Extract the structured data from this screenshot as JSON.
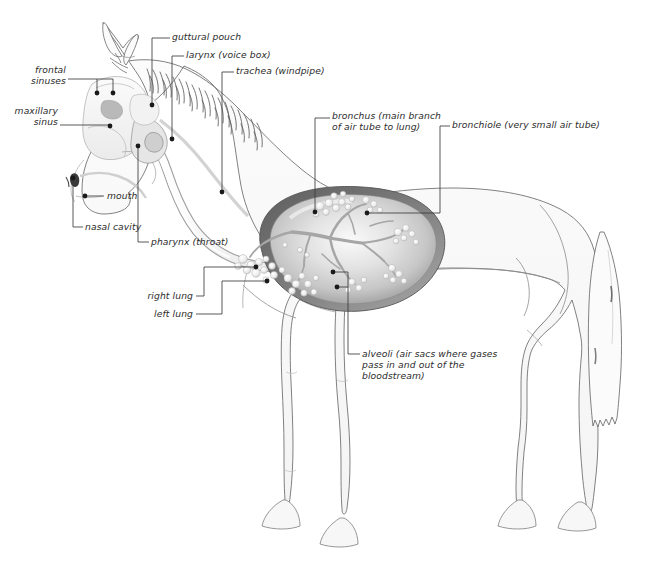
{
  "diagram": {
    "view": "left lateral whole-body cutaway",
    "background_color": "#ffffff",
    "ink_color": "#4a4a4a",
    "label_color": "#2b2b2b",
    "leader_color": "#3b3b3b",
    "body_fill": "#fbfbfb",
    "lung_rim_color": "#6e6e6e",
    "lung_fill_color": "#d8d8d8",
    "trachea_color": "#fdfdfd"
  },
  "labels": {
    "guttural_pouch": "guttural pouch",
    "larynx": "larynx (voice box)",
    "trachea": "trachea (windpipe)",
    "bronchus_line1": "bronchus (main branch",
    "bronchus_line2": "of air tube to lung)",
    "bronchiole": "bronchiole (very small air tube)",
    "frontal_sinuses_line1": "frontal",
    "frontal_sinuses_line2": "sinuses",
    "maxillary_sinus_line1": "maxillary",
    "maxillary_sinus_line2": "sinus",
    "mouth": "mouth",
    "nasal_cavity": "nasal cavity",
    "pharynx": "pharynx (throat)",
    "right_lung": "right lung",
    "left_lung": "left lung",
    "alveoli_line1": "alveoli (air sacs where gases",
    "alveoli_line2": "pass in and out of the",
    "alveoli_line3": "bloodstream)"
  },
  "callouts": [
    {
      "key": "guttural_pouch",
      "text": "guttural pouch",
      "dot": [
        152,
        105
      ],
      "side": "left"
    },
    {
      "key": "larynx",
      "text": "larynx (voice box)",
      "dot": [
        172,
        139
      ],
      "side": "left"
    },
    {
      "key": "trachea",
      "text": "trachea (windpipe)",
      "dot": [
        222,
        192
      ],
      "side": "left"
    },
    {
      "key": "bronchus",
      "text": "bronchus (main branch of air tube to lung)",
      "dot": [
        315,
        212
      ],
      "side": "left"
    },
    {
      "key": "bronchiole",
      "text": "bronchiole (very small air tube)",
      "dot": [
        367,
        213
      ],
      "side": "left"
    },
    {
      "key": "frontal_sinuses",
      "text": "frontal sinuses",
      "dots": [
        [
          97,
          93
        ],
        [
          113,
          93
        ]
      ],
      "side": "right"
    },
    {
      "key": "maxillary_sinus",
      "text": "maxillary sinus",
      "dots": [
        [
          110,
          126
        ]
      ],
      "side": "right"
    },
    {
      "key": "mouth",
      "text": "mouth",
      "dots": [
        [
          85,
          196
        ]
      ],
      "side": "left"
    },
    {
      "key": "nasal_cavity",
      "text": "nasal cavity",
      "dots": [
        [
          73,
          178
        ]
      ],
      "side": "left"
    },
    {
      "key": "pharynx",
      "text": "pharynx (throat)",
      "dots": [
        [
          138,
          146
        ]
      ],
      "side": "left"
    },
    {
      "key": "right_lung",
      "text": "right lung",
      "dots": [
        [
          256,
          267
        ]
      ],
      "side": "left"
    },
    {
      "key": "left_lung",
      "text": "left lung",
      "dots": [
        [
          267,
          281
        ]
      ],
      "side": "left"
    },
    {
      "key": "alveoli",
      "text": "alveoli (air sacs where gases pass in and out of the bloodstream)",
      "dots": [
        [
          333,
          272
        ],
        [
          337,
          287
        ]
      ],
      "side": "left"
    }
  ],
  "structures": [
    "head",
    "ears",
    "mane",
    "neck",
    "barrel",
    "foreleg-front",
    "foreleg-rear",
    "hindleg-front",
    "hindleg-rear",
    "hooves",
    "tail",
    "skull",
    "nostril",
    "trachea-tube",
    "lung",
    "bronchial-tree",
    "alveolar-clusters"
  ]
}
